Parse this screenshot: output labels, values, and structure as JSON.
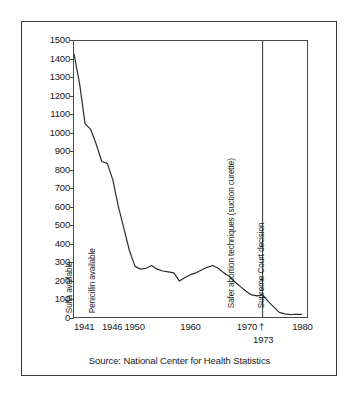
{
  "figure": {
    "source_note": "Source: National Center for Health Statistics"
  },
  "chart_data": {
    "type": "line",
    "title": "",
    "subtitle": "",
    "xlabel": "",
    "ylabel": "",
    "xlim": [
      1939,
      1981
    ],
    "ylim": [
      0,
      1500
    ],
    "grid": false,
    "legend": null,
    "y_ticks": [
      0,
      100,
      200,
      300,
      400,
      500,
      600,
      700,
      800,
      900,
      1000,
      1100,
      1200,
      1300,
      1400,
      1500
    ],
    "y_tick_labels": [
      "0",
      "100",
      "200",
      "300",
      "400",
      "500",
      "600",
      "700",
      "800",
      "900",
      "1000",
      "1100",
      "1200",
      "1300",
      "1400",
      "1500"
    ],
    "x_ticks": [
      1941,
      1946,
      1950,
      1960,
      1970,
      1980
    ],
    "x_tick_labels": [
      "1941",
      "1946",
      "1950",
      "1960",
      "1970",
      "1980"
    ],
    "x_tick_marker": "†",
    "x_sub_tick": {
      "value": 1973,
      "label": "1973"
    },
    "series": [
      {
        "name": "Maternal mortality rate",
        "x": [
          1939,
          1940,
          1941,
          1942,
          1943,
          1944,
          1945,
          1946,
          1947,
          1948,
          1949,
          1950,
          1951,
          1952,
          1953,
          1954,
          1955,
          1956,
          1957,
          1958,
          1959,
          1960,
          1961,
          1962,
          1963,
          1964,
          1965,
          1966,
          1967,
          1968,
          1969,
          1970,
          1971,
          1972,
          1973,
          1974,
          1975,
          1976,
          1977,
          1978,
          1979,
          1980
        ],
        "values": [
          1430,
          1270,
          1050,
          1020,
          940,
          845,
          835,
          745,
          600,
          480,
          360,
          275,
          260,
          265,
          280,
          260,
          250,
          245,
          240,
          195,
          215,
          230,
          240,
          255,
          270,
          280,
          265,
          240,
          220,
          190,
          165,
          140,
          120,
          115,
          120,
          85,
          55,
          25,
          17,
          13,
          15,
          14
        ]
      }
    ],
    "annotations": [
      {
        "id": "sulfa",
        "label": "Sulfa available",
        "x": 1938.6,
        "orientation": "vertical"
      },
      {
        "id": "penicillin",
        "label": "Penicillin available",
        "x": 1942.8,
        "orientation": "vertical"
      },
      {
        "id": "suction-curette",
        "label": "Safer abortion techniques (suction curette)",
        "x": 1967.6,
        "orientation": "vertical"
      },
      {
        "id": "supreme-court",
        "label": "Supreme Court decision",
        "x": 1973,
        "orientation": "vertical",
        "has_rule": true
      }
    ],
    "event_line": {
      "x": 1973,
      "from": 0,
      "to": 1500
    },
    "colors": {
      "line": "#2b2b2b",
      "axis": "#4a4a4a",
      "frame": "#3a3a3a",
      "text": "#1a1a1a",
      "background": "#ffffff"
    }
  }
}
